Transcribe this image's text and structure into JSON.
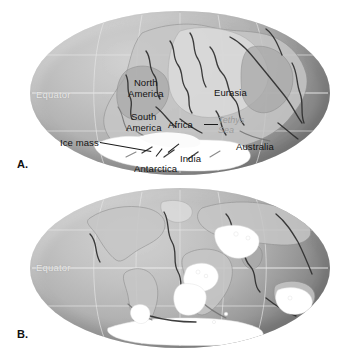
{
  "figure": {
    "type": "two-panel-paleogeographic-map",
    "background_color": "#ffffff",
    "ocean_color": "#bdbdbd",
    "ice_color": "#ffffff",
    "label_color": "#131313",
    "equator_color": "#e9e9e9",
    "sea_label_color": "#9b9b9b"
  },
  "panels": [
    {
      "id": "A",
      "letter": "A.",
      "projection": "oval (Mollweide)",
      "description": "Pangaea supercontinent with late Paleozoic ice sheet",
      "equator_label": "Equator",
      "labels": [
        {
          "name": "north-america",
          "text": "North\nAmerica"
        },
        {
          "name": "south-america",
          "text": "South\nAmerica"
        },
        {
          "name": "africa",
          "text": "Africa"
        },
        {
          "name": "eurasia",
          "text": "Eurasia"
        },
        {
          "name": "india",
          "text": "India"
        },
        {
          "name": "australia",
          "text": "Australia"
        },
        {
          "name": "antarctica",
          "text": "Antarctica"
        },
        {
          "name": "ice-mass",
          "text": "Ice mass"
        }
      ],
      "italic_labels": [
        {
          "name": "tethys-sea",
          "text": "Tethys\nSea"
        }
      ]
    },
    {
      "id": "B",
      "letter": "B.",
      "projection": "oval (Mollweide)",
      "description": "Present-day continents showing remnants of glacial deposits",
      "equator_label": "Equator",
      "labels": [],
      "italic_labels": []
    }
  ]
}
